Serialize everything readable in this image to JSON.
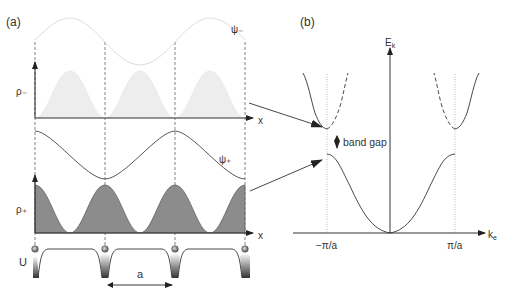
{
  "panel_a": {
    "label": "(a)",
    "psi_minus_label": "ψ₋",
    "psi_plus_label": "ψ₊",
    "rho_minus_label": "ρ₋",
    "rho_plus_label": "ρ₊",
    "x_label_top": "x",
    "x_label_bottom": "x",
    "potential_label": "U",
    "lattice_constant_label": "a"
  },
  "panel_b": {
    "label": "(b)",
    "y_axis_label": "E",
    "y_axis_subscript": "k",
    "x_axis_label": "k",
    "x_axis_subscript": "e",
    "tick_left": "−π/a",
    "tick_right": "π/a",
    "band_gap_label": "band gap"
  },
  "colors": {
    "line": "#555555",
    "rho_plus_fill": "#8a8a8a",
    "rho_minus_fill": "#ececec",
    "psi_minus_line": "#e2e2e2",
    "dashed": "#666666",
    "dotted": "#aaaaaa"
  }
}
